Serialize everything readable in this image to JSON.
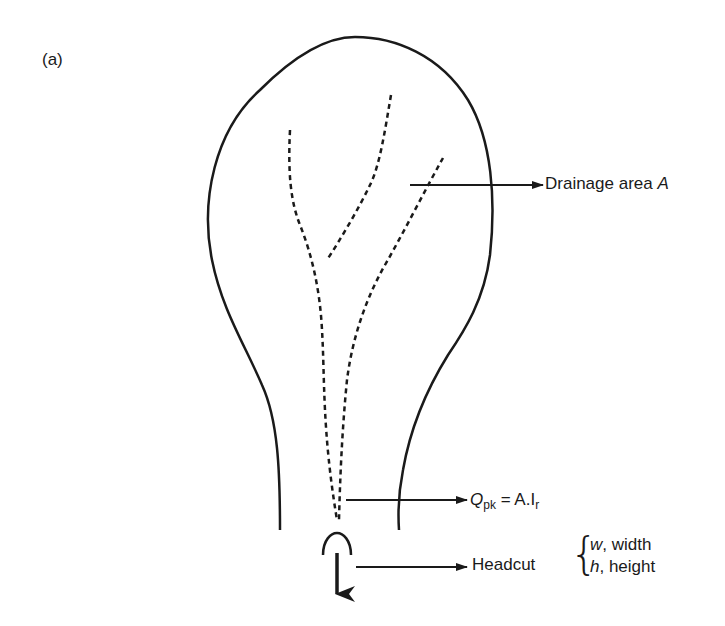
{
  "figure": {
    "panel_label": "(a)",
    "labels": {
      "drainage_area_text": "Drainage area ",
      "drainage_area_symbol": "A",
      "peak_flow_symbol": "Q",
      "peak_flow_subscript": "pk",
      "peak_flow_equation_rhs": " = A.I",
      "peak_flow_rhs_subscript": "r",
      "headcut_label": "Headcut",
      "headcut_width_symbol": "w",
      "headcut_width_text": ", width",
      "headcut_height_symbol": "h",
      "headcut_height_text": ", height"
    },
    "elements": [
      "catchment-outline",
      "dashed-drainage-channels",
      "drainage-area-arrow",
      "peak-flow-arrow",
      "headcut-arc",
      "headcut-arrow",
      "downstream-flow-arrow"
    ],
    "colors": {
      "line": "#1a1a1a",
      "background": "#ffffff"
    }
  }
}
